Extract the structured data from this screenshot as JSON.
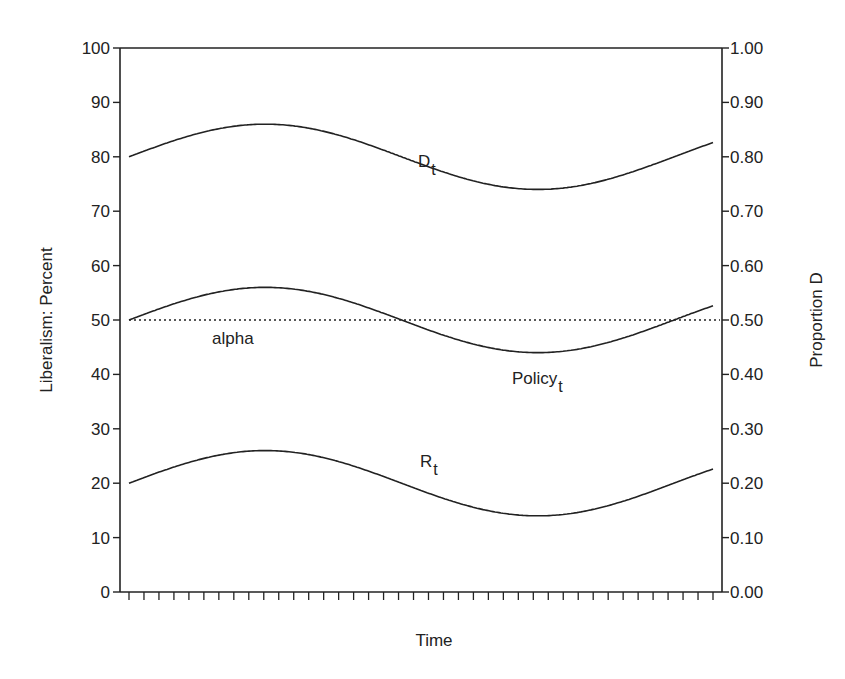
{
  "chart_data": {
    "type": "line",
    "title": "",
    "xlabel": "Time",
    "ylabel": "Liberalism: Percent",
    "y2label": "Proportion D",
    "ylim": [
      0,
      100
    ],
    "y2lim": [
      0.0,
      1.0
    ],
    "yticks": [
      "0",
      "10",
      "20",
      "30",
      "40",
      "50",
      "60",
      "70",
      "80",
      "90",
      "100"
    ],
    "y2ticks": [
      "0.00",
      "0.10",
      "0.20",
      "0.30",
      "0.40",
      "0.50",
      "0.60",
      "0.70",
      "0.80",
      "0.90",
      "1.00"
    ],
    "x_tick_count": 40,
    "x_tick_labels": [],
    "grid": false,
    "legend": "none (inline annotations)",
    "series": [
      {
        "name": "D_t",
        "label_main": "D",
        "label_sub": "t",
        "style": "solid",
        "center": 80,
        "amplitude": 6,
        "start": 80,
        "peak": 86,
        "trough": 74,
        "end": 81.5
      },
      {
        "name": "Policy_t",
        "label_main": "Policy",
        "label_sub": "t",
        "style": "solid",
        "center": 50,
        "amplitude": 6,
        "start": 50,
        "peak": 56,
        "trough": 44,
        "end": 51.5
      },
      {
        "name": "R_t",
        "label_main": "R",
        "label_sub": "t",
        "style": "solid",
        "center": 20,
        "amplitude": 6,
        "start": 20,
        "peak": 26,
        "trough": 14,
        "end": 21.5
      },
      {
        "name": "alpha",
        "label_main": "alpha",
        "label_sub": "",
        "style": "dotted",
        "constant": 50
      }
    ]
  }
}
